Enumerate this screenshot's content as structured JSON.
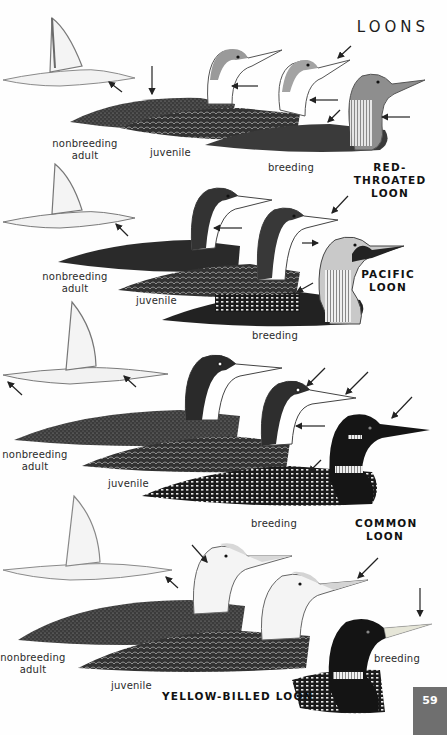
{
  "page": {
    "section_title": "LOONS",
    "page_number": "59"
  },
  "species": [
    {
      "name_line1": "RED-THROATED",
      "name_line2": "LOON",
      "labels": {
        "nonbreeding_line1": "nonbreeding",
        "nonbreeding_line2": "adult",
        "juvenile": "juvenile",
        "breeding": "breeding"
      }
    },
    {
      "name_line1": "PACIFIC",
      "name_line2": "LOON",
      "labels": {
        "nonbreeding_line1": "nonbreeding",
        "nonbreeding_line2": "adult",
        "juvenile": "juvenile",
        "breeding": "breeding"
      }
    },
    {
      "name_line1": "COMMON",
      "name_line2": "LOON",
      "labels": {
        "nonbreeding_line1": "nonbreeding",
        "nonbreeding_line2": "adult",
        "juvenile": "juvenile",
        "breeding": "breeding"
      }
    },
    {
      "name_line1": "YELLOW-BILLED LOON",
      "labels": {
        "nonbreeding_line1": "nonbreeding",
        "nonbreeding_line2": "adult",
        "juvenile": "juvenile",
        "breeding": "breeding"
      }
    }
  ],
  "illustration_icons": [
    "flying-loon-icon",
    "loon-nonbreeding-icon",
    "loon-juvenile-icon",
    "loon-breeding-icon",
    "field-mark-arrow-icon"
  ]
}
